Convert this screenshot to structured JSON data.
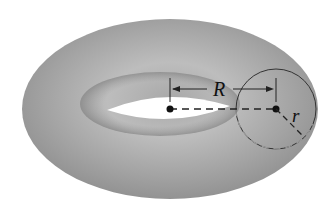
{
  "diagram": {
    "labels": {
      "major_radius": "R",
      "minor_radius": "r"
    },
    "colors": {
      "surface": "#9a9a9a",
      "surface_light": "#c4c4c4",
      "surface_dark": "#7e7e7e",
      "hole": "#ffffff",
      "lines": "#222222"
    }
  }
}
